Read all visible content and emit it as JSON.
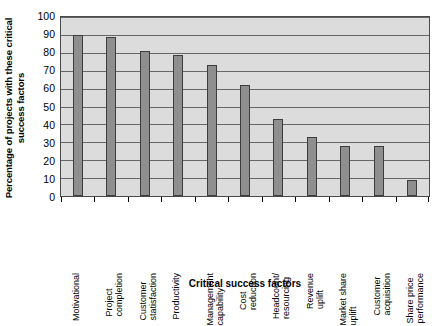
{
  "chart_data": {
    "type": "bar",
    "title": "",
    "xlabel": "Critical success factors",
    "ylabel": "Percentage of projects with these critical success factors",
    "ylabel_lines": [
      "Percentage of projects with these critical",
      "success factors"
    ],
    "categories": [
      "Motivational",
      "Project completion",
      "Customer statisfaction",
      "Productivity",
      "Management capability",
      "Cost reduction",
      "Headcount/ resourcing",
      "Revenue uplift",
      "Market share uplift",
      "Customer acquisition",
      "Share price performance"
    ],
    "category_lines": [
      [
        "Motivational"
      ],
      [
        "Project",
        "completion"
      ],
      [
        "Customer",
        "statisfaction"
      ],
      [
        "Productivity"
      ],
      [
        "Management",
        "capability"
      ],
      [
        "Cost",
        "reduction"
      ],
      [
        "Headcount/",
        "resourcing"
      ],
      [
        "Revenue",
        "uplift"
      ],
      [
        "Market share",
        "uplift"
      ],
      [
        "Customer",
        "acquisition"
      ],
      [
        "Share price",
        "performance"
      ]
    ],
    "values": [
      90,
      89,
      81,
      79,
      73,
      62,
      43,
      33,
      28,
      28,
      9
    ],
    "ylim": [
      0,
      100
    ],
    "ytick_values": [
      0,
      10,
      20,
      30,
      40,
      50,
      60,
      70,
      80,
      90,
      100
    ],
    "ytick_labels": [
      "0",
      "10",
      "20",
      "30",
      "40",
      "50",
      "60",
      "70",
      "80",
      "90",
      "100"
    ],
    "grid": true,
    "legend": null,
    "colors": {
      "bar_fill": "#8f8f8f",
      "bar_edge": "#3d3d3d",
      "plot_background": "#dcdcdc",
      "gridline": "#666666",
      "axis": "#4a4a4a",
      "text": "#000000",
      "page_background": "#ffffff"
    }
  }
}
